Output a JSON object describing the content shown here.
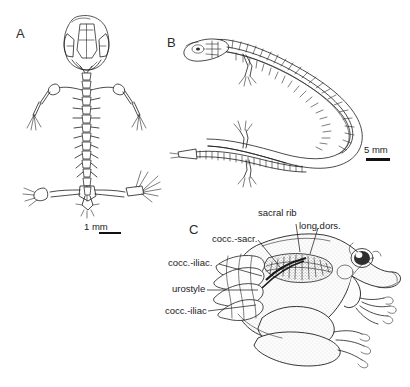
{
  "figure": {
    "background_color": "#ffffff",
    "ink_color": "#1d1d1d",
    "width": 410,
    "height": 387
  },
  "panels": [
    {
      "letter": "A",
      "subject": "larval-amphibian-skeleton-dorsal-view",
      "scale_bar": {
        "label": "1 mm",
        "length_px": 22
      }
    },
    {
      "letter": "B",
      "subject": "elongate-salamander-skeleton-dorsal-view-curved",
      "scale_bar": {
        "label": "5 mm",
        "length_px": 24
      }
    },
    {
      "letter": "C",
      "subject": "frog-lateral-view-with-pelvic-musculature",
      "scale_bar": null
    }
  ],
  "annotations": {
    "sacral_rib": "sacral rib",
    "long_dors": "long.dors.",
    "cocc_sacr": "cocc.-sacr.",
    "cocc_iliac_upper": "cocc.-iliac.",
    "urostyle": "urostyle",
    "cocc_iliac_lower": "cocc.-iliac"
  }
}
